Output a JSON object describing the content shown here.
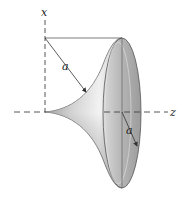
{
  "diagram": {
    "type": "pseudosphere (tractricoid) surface of revolution",
    "labels": {
      "x_axis": "x",
      "z_axis": "z",
      "tangent_length": "a",
      "rim_radius": "a"
    },
    "colors": {
      "surface_light": "#e8e8e8",
      "surface_dark": "#9a9a9a",
      "rim_face": "#b8b8b8",
      "line": "#333333",
      "axis": "#444444",
      "background": "#ffffff"
    }
  }
}
